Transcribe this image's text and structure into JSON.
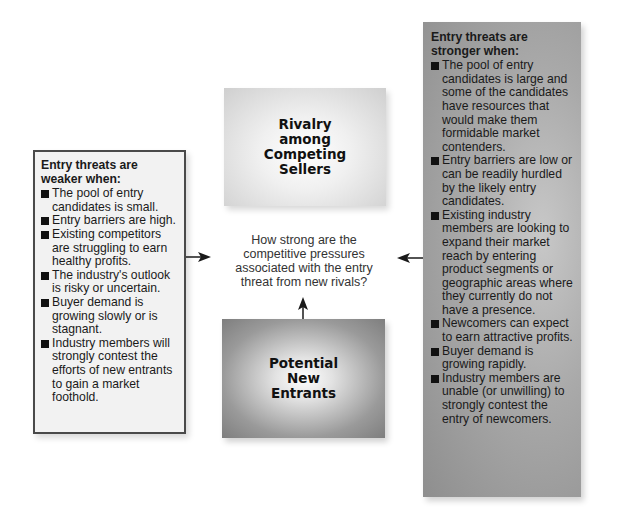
{
  "diagram": {
    "center_question": "How strong are the\ncompetitive pressures\nassociated with the entry\nthreat from new rivals?",
    "rivalry_box": {
      "label": "Rivalry\namong\nCompeting\nSellers"
    },
    "entrants_box": {
      "label": "Potential\nNew\nEntrants"
    },
    "weaker_box": {
      "title": "Entry threats are weaker when:",
      "items": [
        "The pool of entry candidates is small.",
        "Entry barriers are high.",
        "Existing competitors are struggling to earn healthy profits.",
        "The industry's outlook is risky or uncertain.",
        "Buyer demand is growing slowly or is stagnant.",
        "Industry members will strongly contest the efforts of new entrants to gain a market foothold."
      ]
    },
    "stronger_box": {
      "title": "Entry threats are stronger when:",
      "items": [
        "The pool of entry candidates is large and some of the candidates have resources that would make them formidable market contenders.",
        "Entry barriers are low or can be readily hurdled by the likely entry candidates.",
        "Existing industry members are looking to expand their market reach by entering product segments or geographic areas where they currently do not have a presence.",
        "Newcomers can expect to earn attractive profits.",
        "Buyer demand is growing rapidly.",
        "Industry members are unable (or unwilling) to strongly contest the entry of newcomers."
      ]
    },
    "colors": {
      "arrow": "#1a1a1a",
      "weaker_box_bg": "#f2f2f2",
      "weaker_box_border": "#4a4a4a",
      "stronger_box_bg": "#a9a9a9"
    }
  }
}
